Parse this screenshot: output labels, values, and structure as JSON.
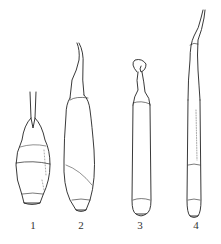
{
  "figure": {
    "specimens": [
      {
        "id": 1,
        "label": "1"
      },
      {
        "id": 2,
        "label": "2"
      },
      {
        "id": 3,
        "label": "3"
      },
      {
        "id": 4,
        "label": "4"
      }
    ]
  }
}
